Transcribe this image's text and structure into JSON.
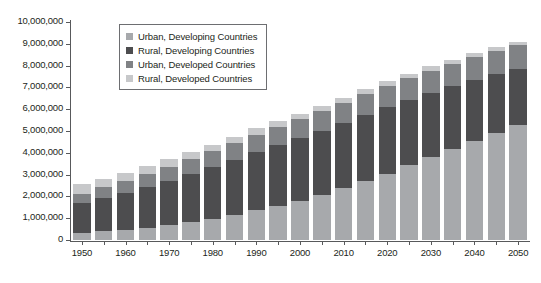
{
  "chart_data": {
    "type": "bar",
    "stacked": true,
    "title": "",
    "xlabel": "",
    "ylabel": "",
    "ylim": [
      0,
      10000000
    ],
    "ytick_step": 1000000,
    "grid": false,
    "legend_position": "top-left-inside",
    "ytick_labels": [
      "0",
      "1,000,000",
      "2,000,000",
      "3,000,000",
      "4,000,000",
      "5,000,000",
      "6,000,000",
      "7,000,000",
      "8,000,000",
      "9,000,000",
      "10,000,000"
    ],
    "categories": [
      "1950",
      "1955",
      "1960",
      "1965",
      "1970",
      "1975",
      "1980",
      "1985",
      "1990",
      "1995",
      "2000",
      "2005",
      "2010",
      "2015",
      "2020",
      "2025",
      "2030",
      "2035",
      "2040",
      "2045",
      "2050"
    ],
    "xtick_labels": [
      "1950",
      "",
      "1960",
      "",
      "1970",
      "",
      "1980",
      "",
      "1990",
      "",
      "2000",
      "",
      "2010",
      "",
      "2020",
      "",
      "2030",
      "",
      "2040",
      "",
      "2050"
    ],
    "series": [
      {
        "name": "Urban, Developing Countries",
        "color": "#a7a9ac",
        "values": [
          300000,
          400000,
          460000,
          560000,
          670000,
          810000,
          970000,
          1150000,
          1360000,
          1580000,
          1800000,
          2060000,
          2370000,
          2700000,
          3050000,
          3420000,
          3800000,
          4180000,
          4560000,
          4930000,
          5280000
        ]
      },
      {
        "name": "Rural, Developing Countries",
        "color": "#4d4d4f",
        "values": [
          1400000,
          1530000,
          1690000,
          1860000,
          2040000,
          2210000,
          2380000,
          2530000,
          2680000,
          2790000,
          2880000,
          2950000,
          3000000,
          3030000,
          3030000,
          3000000,
          2950000,
          2870000,
          2780000,
          2680000,
          2580000
        ]
      },
      {
        "name": "Urban, Developed Countries",
        "color": "#808285",
        "values": [
          430000,
          490000,
          540000,
          600000,
          650000,
          700000,
          730000,
          770000,
          800000,
          830000,
          860000,
          890000,
          920000,
          950000,
          980000,
          1000000,
          1020000,
          1040000,
          1060000,
          1070000,
          1080000
        ]
      },
      {
        "name": "Rural, Developed Countries",
        "color": "#c7c8ca",
        "values": [
          420000,
          400000,
          380000,
          360000,
          340000,
          320000,
          300000,
          290000,
          280000,
          270000,
          260000,
          250000,
          240000,
          230000,
          220000,
          210000,
          200000,
          190000,
          180000,
          170000,
          160000
        ]
      }
    ]
  },
  "legend": {
    "items": [
      {
        "label": "Urban, Developing Countries",
        "color": "#a7a9ac"
      },
      {
        "label": "Rural, Developing Countries",
        "color": "#4d4d4f"
      },
      {
        "label": "Urban, Developed Countries",
        "color": "#808285"
      },
      {
        "label": "Rural, Developed Countries",
        "color": "#c7c8ca"
      }
    ]
  },
  "colors": {
    "axis": "#58595b",
    "text": "#231f20",
    "background": "#ffffff",
    "bar_gap_stroke": "#ffffff"
  }
}
